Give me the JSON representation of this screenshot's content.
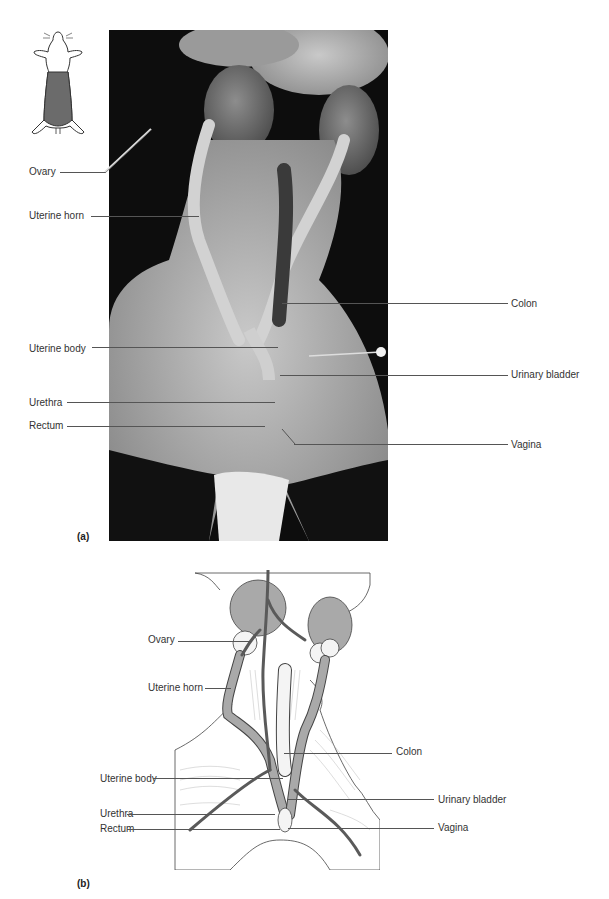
{
  "figure": {
    "panels": [
      {
        "id": "a",
        "letter": "(a)",
        "type": "dissection-photograph",
        "labels_left": [
          "Ovary",
          "Uterine horn",
          "Uterine body",
          "Urethra",
          "Rectum"
        ],
        "labels_right": [
          "Colon",
          "Urinary bladder",
          "Vagina"
        ]
      },
      {
        "id": "b",
        "letter": "(b)",
        "type": "line-illustration",
        "labels_left": [
          "Ovary",
          "Uterine horn",
          "Uterine body",
          "Urethra",
          "Rectum"
        ],
        "labels_right": [
          "Colon",
          "Urinary bladder",
          "Vagina"
        ]
      }
    ],
    "orientation_icon": "rat-ventral-silhouette-icon",
    "colors": {
      "background": "#ffffff",
      "photo_background": "#0d0d0d",
      "organ_fill": "#a6a6a6",
      "vessel": "#5a5a5a",
      "outline": "#444444",
      "shaded_region": "#6b6b6b"
    }
  },
  "a": {
    "letter": "(a)",
    "ovary": "Ovary",
    "uterine_horn": "Uterine horn",
    "uterine_body": "Uterine body",
    "urethra": "Urethra",
    "rectum": "Rectum",
    "colon": "Colon",
    "urinary_bladder": "Urinary bladder",
    "vagina": "Vagina"
  },
  "b": {
    "letter": "(b)",
    "ovary": "Ovary",
    "uterine_horn": "Uterine horn",
    "uterine_body": "Uterine body",
    "urethra": "Urethra",
    "rectum": "Rectum",
    "colon": "Colon",
    "urinary_bladder": "Urinary bladder",
    "vagina": "Vagina"
  }
}
